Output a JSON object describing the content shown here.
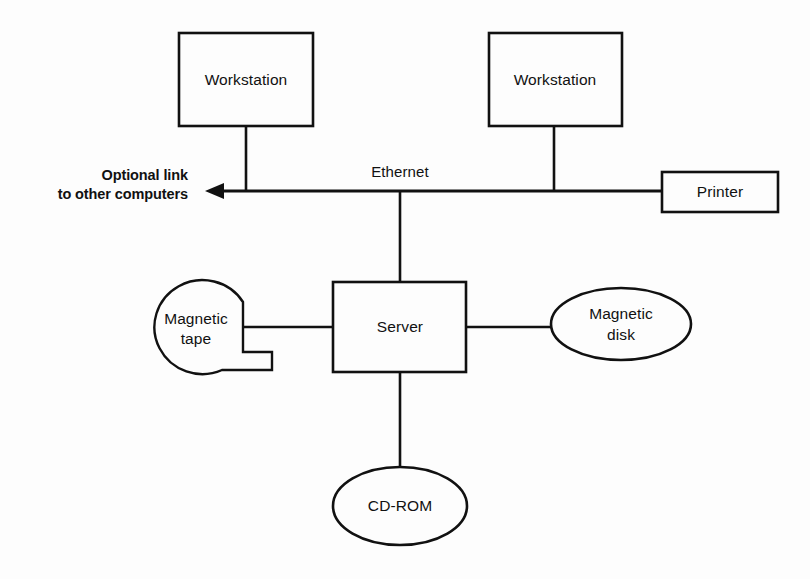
{
  "diagram": {
    "type": "network-topology",
    "background_color": "#fdfdfd",
    "line_color": "#111111",
    "nodes": {
      "workstation_left": {
        "label": "Workstation",
        "shape": "rectangle"
      },
      "workstation_right": {
        "label": "Workstation",
        "shape": "rectangle"
      },
      "printer": {
        "label": "Printer",
        "shape": "rectangle"
      },
      "server": {
        "label": "Server",
        "shape": "rectangle"
      },
      "magnetic_tape": {
        "label_line1": "Magnetic",
        "label_line2": "tape",
        "shape": "tape-reel"
      },
      "magnetic_disk": {
        "label_line1": "Magnetic",
        "label_line2": "disk",
        "shape": "ellipse"
      },
      "cdrom": {
        "label": "CD-ROM",
        "shape": "ellipse"
      }
    },
    "bus": {
      "label": "Ethernet"
    },
    "annotation": {
      "line1": "Optional link",
      "line2": "to other computers",
      "arrow": "left-arrow"
    }
  }
}
